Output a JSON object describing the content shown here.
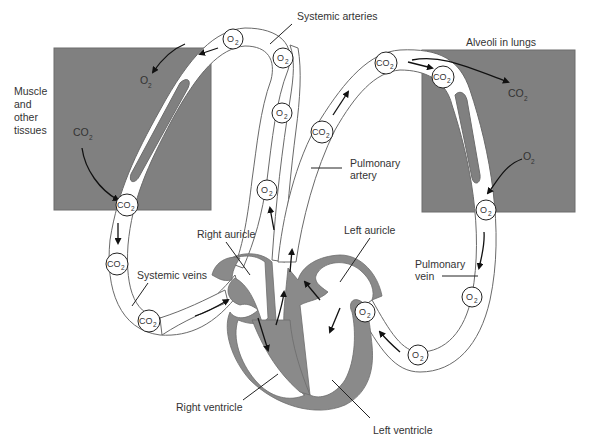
{
  "diagram": {
    "colors": {
      "tissue_fill": "#808080",
      "heart_muscle": "#8a8a8a",
      "vessel_fill": "#ffffff",
      "outline": "#6a6a6a",
      "text": "#333333"
    },
    "regions": {
      "muscle_tissues": "Muscle\nand\nother\ntissues",
      "muscle_line1": "Muscle",
      "muscle_line2": "and",
      "muscle_line3": "other",
      "muscle_line4": "tissues",
      "alveoli": "Alveoli in lungs"
    },
    "labels": {
      "systemic_arteries": "Systemic arteries",
      "pulmonary_artery_1": "Pulmonary",
      "pulmonary_artery_2": "artery",
      "pulmonary_vein_1": "Pulmonary",
      "pulmonary_vein_2": "vein",
      "systemic_veins": "Systemic veins",
      "right_auricle": "Right auricle",
      "left_auricle": "Left auricle",
      "right_ventricle": "Right ventricle",
      "left_ventricle": "Left ventricle"
    },
    "molecules": {
      "o2_base": "O",
      "co2_base": "CO",
      "subscript": "2"
    },
    "cells": [
      {
        "gas": "O2",
        "x": 233,
        "y": 39
      },
      {
        "gas": "O2",
        "x": 283,
        "y": 58
      },
      {
        "gas": "O2",
        "x": 282,
        "y": 113
      },
      {
        "gas": "O2",
        "x": 267,
        "y": 190
      },
      {
        "gas": "CO2",
        "x": 127,
        "y": 205
      },
      {
        "gas": "CO2",
        "x": 117,
        "y": 264
      },
      {
        "gas": "CO2",
        "x": 149,
        "y": 321
      },
      {
        "gas": "CO2",
        "x": 322,
        "y": 132
      },
      {
        "gas": "CO2",
        "x": 386,
        "y": 63
      },
      {
        "gas": "CO2",
        "x": 443,
        "y": 77
      },
      {
        "gas": "O2",
        "x": 486,
        "y": 210
      },
      {
        "gas": "O2",
        "x": 472,
        "y": 297
      },
      {
        "gas": "O2",
        "x": 365,
        "y": 312
      },
      {
        "gas": "O2",
        "x": 418,
        "y": 355
      }
    ],
    "free_gas": [
      {
        "gas": "O2",
        "x": 148,
        "y": 82,
        "label_base": "O",
        "label_sub": "2"
      },
      {
        "gas": "CO2",
        "x": 82,
        "y": 133,
        "label_base": "CO",
        "label_sub": "2"
      },
      {
        "gas": "CO2",
        "x": 514,
        "y": 94,
        "label_base": "CO",
        "label_sub": "2"
      },
      {
        "gas": "O2",
        "x": 528,
        "y": 159,
        "label_base": "O",
        "label_sub": "2"
      }
    ]
  }
}
